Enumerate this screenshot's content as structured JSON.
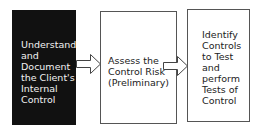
{
  "diagram": {
    "type": "process-flow",
    "steps": [
      {
        "label": "Understand\nand\nDocument\nthe Client's\nInternal\nControl",
        "fill": "#111111",
        "text_color": "#f2f2f2"
      },
      {
        "label": "Assess the\nControl Risk\n(Preliminary)",
        "fill": "#ffffff",
        "text_color": "#222222"
      },
      {
        "label": "Identify\nControls\nto Test\nand\nperform\nTests of\nControl",
        "fill": "#ffffff",
        "text_color": "#222222"
      }
    ],
    "connectors": [
      {
        "from": 0,
        "to": 1,
        "style": "hollow-block-arrow"
      },
      {
        "from": 1,
        "to": 2,
        "style": "hollow-block-arrow"
      }
    ]
  }
}
